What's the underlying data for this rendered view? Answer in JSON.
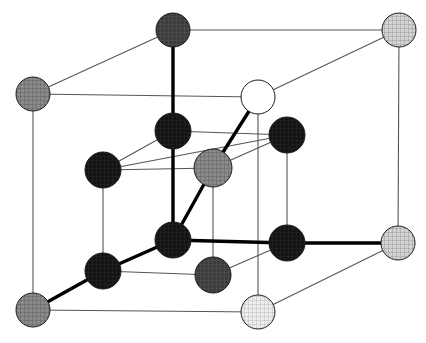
{
  "figure": {
    "width": 426,
    "height": 343,
    "background": "#ffffff",
    "bond_colors": {
      "cell_edge": "#555555",
      "bond_thick": "#000000"
    },
    "bond_widths": {
      "cell_edge": 1.1,
      "bond_thick": 3.4
    }
  },
  "palette": {
    "black": "#141414",
    "dark_gray": "#2c2c2c",
    "mid_gray": "#4a4a4a",
    "gray": "#808080",
    "light_gray": "#b8b8b8",
    "pale_gray": "#d8d8d8",
    "white": "#ffffff",
    "outline": "#1a1a1a"
  },
  "atoms": [
    {
      "id": "corner-back-top-left",
      "name": "atom-corner-back-top-left",
      "cx": 173,
      "cy": 30,
      "r": 17,
      "fill": "#4a4a4a",
      "pattern": "crosshatch-dark",
      "shade_label": "dark gray hatched"
    },
    {
      "id": "corner-back-top-right",
      "name": "atom-corner-back-top-right",
      "cx": 399,
      "cy": 30,
      "r": 17,
      "fill": "#c9c9c9",
      "pattern": "crosshatch-light",
      "shade_label": "light gray hatched"
    },
    {
      "id": "corner-front-top-left",
      "name": "atom-corner-front-top-left",
      "cx": 33,
      "cy": 94,
      "r": 17,
      "fill": "#8f8f8f",
      "pattern": "crosshatch-mid",
      "shade_label": "medium gray hatched"
    },
    {
      "id": "corner-front-top-right",
      "name": "atom-corner-front-top-right",
      "cx": 258,
      "cy": 97,
      "r": 17,
      "fill": "#ffffff",
      "pattern": "none",
      "shade_label": "white open circle"
    },
    {
      "id": "corner-back-bot-right",
      "name": "atom-corner-back-bottom-right",
      "cx": 398,
      "cy": 243,
      "r": 17,
      "fill": "#bdbdbd",
      "pattern": "crosshatch-light",
      "shade_label": "light gray hatched"
    },
    {
      "id": "corner-front-bot-left",
      "name": "atom-corner-front-bottom-left",
      "cx": 33,
      "cy": 310,
      "r": 17,
      "fill": "#9a9a9a",
      "pattern": "crosshatch-mid",
      "shade_label": "medium gray hatched"
    },
    {
      "id": "corner-front-bot-right",
      "name": "atom-corner-front-bottom-right",
      "cx": 258,
      "cy": 312,
      "r": 17,
      "fill": "#e2e2e2",
      "pattern": "crosshatch-pale",
      "shade_label": "pale gray hatched"
    },
    {
      "id": "interior-upper-mid",
      "name": "atom-interior-upper-mid",
      "cx": 173,
      "cy": 131,
      "r": 18,
      "fill": "#141414",
      "pattern": "crosshatch-black",
      "shade_label": "black"
    },
    {
      "id": "interior-upper-left",
      "name": "atom-interior-upper-left",
      "cx": 103,
      "cy": 170,
      "r": 18,
      "fill": "#141414",
      "pattern": "crosshatch-black",
      "shade_label": "black"
    },
    {
      "id": "interior-upper-right",
      "name": "atom-interior-upper-right",
      "cx": 287,
      "cy": 135,
      "r": 18,
      "fill": "#242424",
      "pattern": "crosshatch-black",
      "shade_label": "black"
    },
    {
      "id": "interior-center",
      "name": "atom-interior-center",
      "cx": 213,
      "cy": 168,
      "r": 19,
      "fill": "#5a5a5a",
      "pattern": "crosshatch-mid",
      "shade_label": "medium gray"
    },
    {
      "id": "interior-lower-mid",
      "name": "atom-interior-lower-mid",
      "cx": 173,
      "cy": 240,
      "r": 18,
      "fill": "#141414",
      "pattern": "crosshatch-black",
      "shade_label": "black"
    },
    {
      "id": "interior-lower-left",
      "name": "atom-interior-lower-left",
      "cx": 103,
      "cy": 271,
      "r": 18,
      "fill": "#141414",
      "pattern": "crosshatch-black",
      "shade_label": "black"
    },
    {
      "id": "interior-lower-right",
      "name": "atom-interior-lower-right",
      "cx": 287,
      "cy": 243,
      "r": 18,
      "fill": "#242424",
      "pattern": "crosshatch-black",
      "shade_label": "black"
    },
    {
      "id": "interior-bottom-mid",
      "name": "atom-interior-bottom-mid",
      "cx": 213,
      "cy": 275,
      "r": 18,
      "fill": "#3a3a3a",
      "pattern": "crosshatch-dark",
      "shade_label": "dark gray"
    }
  ],
  "cell_edges": [
    {
      "name": "edge-back-top",
      "x1": 173,
      "y1": 30,
      "x2": 399,
      "y2": 30
    },
    {
      "name": "edge-back-left-diag",
      "x1": 33,
      "y1": 94,
      "x2": 173,
      "y2": 30
    },
    {
      "name": "edge-front-top",
      "x1": 33,
      "y1": 94,
      "x2": 258,
      "y2": 97
    },
    {
      "name": "edge-top-right-diag",
      "x1": 258,
      "y1": 97,
      "x2": 399,
      "y2": 30
    },
    {
      "name": "edge-left-vertical",
      "x1": 33,
      "y1": 94,
      "x2": 33,
      "y2": 310
    },
    {
      "name": "edge-right-vertical",
      "x1": 399,
      "y1": 30,
      "x2": 398,
      "y2": 243
    },
    {
      "name": "edge-front-bottom",
      "x1": 33,
      "y1": 310,
      "x2": 258,
      "y2": 312
    },
    {
      "name": "edge-bottom-right-diag",
      "x1": 258,
      "y1": 312,
      "x2": 398,
      "y2": 243
    },
    {
      "name": "edge-mid-front-vertical",
      "x1": 258,
      "y1": 97,
      "x2": 258,
      "y2": 312
    },
    {
      "name": "edge-upper-left-row",
      "x1": 103,
      "y1": 170,
      "x2": 287,
      "y2": 135
    },
    {
      "name": "edge-upper-mid-row",
      "x1": 103,
      "y1": 170,
      "x2": 173,
      "y2": 131
    },
    {
      "name": "edge-upper-mid-right",
      "x1": 173,
      "y1": 131,
      "x2": 287,
      "y2": 135
    },
    {
      "name": "edge-inner-left-vert",
      "x1": 103,
      "y1": 170,
      "x2": 103,
      "y2": 271
    },
    {
      "name": "edge-inner-right-vert",
      "x1": 287,
      "y1": 135,
      "x2": 287,
      "y2": 243
    },
    {
      "name": "edge-inner-center-vert",
      "x1": 213,
      "y1": 168,
      "x2": 213,
      "y2": 275
    },
    {
      "name": "edge-lower-left-row",
      "x1": 103,
      "y1": 271,
      "x2": 213,
      "y2": 275
    },
    {
      "name": "edge-lower-right-row",
      "x1": 213,
      "y1": 275,
      "x2": 287,
      "y2": 243
    },
    {
      "name": "edge-center-to-right",
      "x1": 213,
      "y1": 168,
      "x2": 287,
      "y2": 135
    },
    {
      "name": "edge-center-to-left",
      "x1": 103,
      "y1": 170,
      "x2": 213,
      "y2": 168
    },
    {
      "name": "edge-lower-mid-vert",
      "x1": 173,
      "y1": 240,
      "x2": 173,
      "y2": 131
    }
  ],
  "bonds": [
    {
      "name": "bond-top-vertical",
      "x1": 173,
      "y1": 30,
      "x2": 173,
      "y2": 240
    },
    {
      "name": "bond-white-to-center",
      "x1": 258,
      "y1": 97,
      "x2": 213,
      "y2": 168
    },
    {
      "name": "bond-center-to-lower-mid",
      "x1": 213,
      "y1": 168,
      "x2": 173,
      "y2": 240
    },
    {
      "name": "bond-lower-mid-to-left",
      "x1": 173,
      "y1": 240,
      "x2": 103,
      "y2": 271
    },
    {
      "name": "bond-left-to-corner",
      "x1": 103,
      "y1": 271,
      "x2": 33,
      "y2": 310
    },
    {
      "name": "bond-lower-mid-to-right",
      "x1": 173,
      "y1": 240,
      "x2": 287,
      "y2": 243
    },
    {
      "name": "bond-right-to-corner",
      "x1": 287,
      "y1": 243,
      "x2": 398,
      "y2": 243
    }
  ]
}
